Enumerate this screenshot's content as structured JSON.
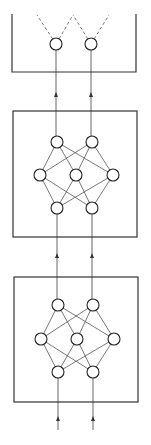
{
  "diagram": {
    "title": "",
    "colors": {
      "stroke": "#333333",
      "node_fill": "#ffffff",
      "background": "#ffffff"
    },
    "blocks": [
      {
        "id": "output-block",
        "box": {
          "x": 12,
          "y": 14,
          "w": 124,
          "h": 58,
          "open_top": true
        },
        "nodes": [
          {
            "id": "o1",
            "cx": 56,
            "cy": 44,
            "r": 6
          },
          {
            "id": "o2",
            "cx": 91,
            "cy": 44,
            "r": 6
          }
        ],
        "dashed_outputs": [
          {
            "from": "o1",
            "to": [
              37,
              15
            ]
          },
          {
            "from": "o1",
            "to": [
              73,
              15
            ]
          },
          {
            "from": "o2",
            "to": [
              73,
              15
            ]
          },
          {
            "from": "o2",
            "to": [
              109,
              15
            ]
          }
        ]
      },
      {
        "id": "hidden-block-2",
        "box": {
          "x": 13,
          "y": 111,
          "w": 124,
          "h": 126,
          "open_top": false
        },
        "layers": [
          [
            {
              "id": "a1",
              "cx": 57,
              "cy": 142
            },
            {
              "id": "a2",
              "cx": 92,
              "cy": 142
            }
          ],
          [
            {
              "id": "b1",
              "cx": 40,
              "cy": 175
            },
            {
              "id": "b2",
              "cx": 76,
              "cy": 175
            },
            {
              "id": "b3",
              "cx": 113,
              "cy": 175
            }
          ],
          [
            {
              "id": "c1",
              "cx": 57,
              "cy": 208
            },
            {
              "id": "c2",
              "cx": 92,
              "cy": 208
            }
          ]
        ],
        "node_radius": 6
      },
      {
        "id": "hidden-block-1",
        "box": {
          "x": 14,
          "y": 277,
          "w": 124,
          "h": 125,
          "open_top": false
        },
        "layers": [
          [
            {
              "id": "d1",
              "cx": 58,
              "cy": 305
            },
            {
              "id": "d2",
              "cx": 93,
              "cy": 305
            }
          ],
          [
            {
              "id": "e1",
              "cx": 41,
              "cy": 339
            },
            {
              "id": "e2",
              "cx": 77,
              "cy": 339
            },
            {
              "id": "e3",
              "cx": 114,
              "cy": 339
            }
          ],
          [
            {
              "id": "f1",
              "cx": 58,
              "cy": 372
            },
            {
              "id": "f2",
              "cx": 93,
              "cy": 372
            }
          ]
        ],
        "node_radius": 6
      }
    ],
    "arrows": [
      {
        "id": "in-left",
        "x": 58,
        "y1": 430,
        "y2": 372,
        "head_y": 420
      },
      {
        "id": "in-right",
        "x": 93,
        "y1": 430,
        "y2": 372,
        "head_y": 420
      },
      {
        "id": "mid-left",
        "x": 57,
        "y1": 305,
        "y2": 208,
        "head_y": 257
      },
      {
        "id": "mid-right",
        "x": 92,
        "y1": 305,
        "y2": 208,
        "head_y": 257
      },
      {
        "id": "top-left",
        "x": 56,
        "y1": 142,
        "y2": 50,
        "head_y": 96
      },
      {
        "id": "top-right",
        "x": 91,
        "y1": 142,
        "y2": 50,
        "head_y": 96
      }
    ]
  }
}
